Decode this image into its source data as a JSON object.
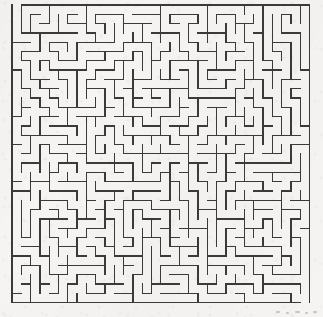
{
  "canvas": {
    "width": 323,
    "height": 317,
    "background_color": "#f5f4f2",
    "page_color": "#ffffff"
  },
  "maze": {
    "title": "Rectangular perfect maze",
    "type": "orthogonal-grid-maze",
    "algorithm": "depth-first-search-backtracker",
    "seed": 20250417,
    "columns": 32,
    "rows": 32,
    "cell_size": 9.3,
    "origin_x": 12.0,
    "origin_y": 5.0,
    "wall_color": "#3a3a3a",
    "wall_width": 1.3,
    "border_width": 1.5,
    "border": true,
    "entrance": {
      "side": "top",
      "index": 0,
      "label": "start-opening"
    },
    "exit": {
      "side": "bottom",
      "index": 31,
      "label": "finish-opening"
    }
  },
  "artifacts": {
    "label": "scan-speckles",
    "marks": [
      {
        "x": 276,
        "y": 311,
        "width": 4,
        "height": 2
      },
      {
        "x": 286,
        "y": 312,
        "width": 3,
        "height": 2
      },
      {
        "x": 295,
        "y": 311,
        "width": 5,
        "height": 2
      },
      {
        "x": 305,
        "y": 312,
        "width": 3,
        "height": 2
      },
      {
        "x": 313,
        "y": 311,
        "width": 4,
        "height": 2
      }
    ]
  }
}
